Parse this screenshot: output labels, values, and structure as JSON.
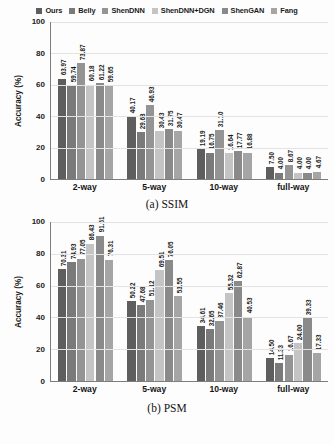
{
  "legend": {
    "items": [
      {
        "label": "Ours",
        "color": "#5e5e5e"
      },
      {
        "label": "Belly",
        "color": "#7a7a7a"
      },
      {
        "label": "ShenDNN",
        "color": "#949494"
      },
      {
        "label": "ShenDNN+DGN",
        "color": "#c4c4c4"
      },
      {
        "label": "ShenGAN",
        "color": "#8a8a8a"
      },
      {
        "label": "Fang",
        "color": "#a5a5a5"
      }
    ]
  },
  "panels": [
    {
      "id": "ssim",
      "caption": "(a) SSIM",
      "ylabel": "Accuracy (%)",
      "yticks": [
        "100",
        "80",
        "60",
        "40",
        "20",
        "0"
      ],
      "xlabels": [
        "2-way",
        "5-way",
        "10-way",
        "full-way"
      ]
    },
    {
      "id": "psm",
      "caption": "(b) PSM",
      "ylabel": "Accuracy (%)",
      "yticks": [
        "100",
        "80",
        "60",
        "40",
        "20",
        "0"
      ],
      "xlabels": [
        "2-way",
        "5-way",
        "10-way",
        "full-way"
      ]
    }
  ],
  "chart_data": [
    {
      "type": "bar",
      "title": "(a) SSIM",
      "xlabel": "",
      "ylabel": "Accuracy (%)",
      "ylim": [
        0,
        100
      ],
      "yticks": [
        0,
        20,
        40,
        60,
        80,
        100
      ],
      "grid": true,
      "legend_position": "top-center",
      "categories": [
        "2-way",
        "5-way",
        "10-way",
        "full-way"
      ],
      "series": [
        {
          "name": "Ours",
          "color": "#5e5e5e",
          "values": [
            63.97,
            40.17,
            19.19,
            7.5
          ]
        },
        {
          "name": "Belly",
          "color": "#7a7a7a",
          "values": [
            59.74,
            29.68,
            16.75,
            4.0
          ]
        },
        {
          "name": "ShenDNN",
          "color": "#949494",
          "values": [
            73.87,
            46.93,
            31.1,
            8.67
          ]
        },
        {
          "name": "ShenDNN+DGN",
          "color": "#c4c4c4",
          "values": [
            60.18,
            30.43,
            16.64,
            4.0
          ]
        },
        {
          "name": "ShenGAN",
          "color": "#8a8a8a",
          "values": [
            61.22,
            31.75,
            17.77,
            4.0
          ]
        },
        {
          "name": "Fang",
          "color": "#a5a5a5",
          "values": [
            59.65,
            30.47,
            16.88,
            4.67
          ]
        }
      ]
    },
    {
      "type": "bar",
      "title": "(b) PSM",
      "xlabel": "",
      "ylabel": "Accuracy (%)",
      "ylim": [
        0,
        100
      ],
      "yticks": [
        0,
        20,
        40,
        60,
        80,
        100
      ],
      "grid": true,
      "legend_position": "top-center",
      "categories": [
        "2-way",
        "5-way",
        "10-way",
        "full-way"
      ],
      "series": [
        {
          "name": "Ours",
          "color": "#5e5e5e",
          "values": [
            70.31,
            50.22,
            34.61,
            14.5
          ]
        },
        {
          "name": "Belly",
          "color": "#7a7a7a",
          "values": [
            74.93,
            47.68,
            32.65,
            11.33
          ]
        },
        {
          "name": "ShenDNN",
          "color": "#949494",
          "values": [
            77.05,
            51.12,
            37.46,
            16.67
          ]
        },
        {
          "name": "ShenDNN+DGN",
          "color": "#c4c4c4",
          "values": [
            86.43,
            69.51,
            55.32,
            24.0
          ]
        },
        {
          "name": "ShenGAN",
          "color": "#8a8a8a",
          "values": [
            91.51,
            76.05,
            62.87,
            39.33
          ]
        },
        {
          "name": "Fang",
          "color": "#a5a5a5",
          "values": [
            76.31,
            53.55,
            40.53,
            17.33
          ]
        }
      ]
    }
  ]
}
